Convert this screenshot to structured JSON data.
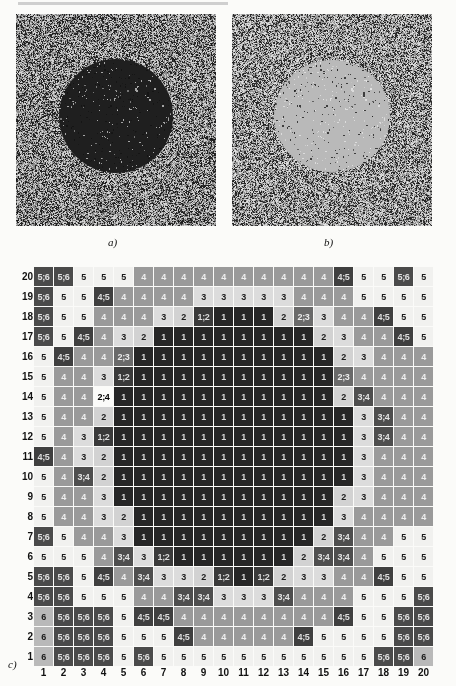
{
  "figure": {
    "panel_a": {
      "caption": "a)",
      "description": "grayscale particle field with dark circular cluster"
    },
    "panel_b": {
      "caption": "b)",
      "description": "grayscale particle field with light circular cluster"
    },
    "panel_c": {
      "caption": "c)"
    }
  },
  "chart_data": {
    "type": "heatmap",
    "title": "",
    "xlabel": "",
    "ylabel": "",
    "grid": true,
    "legend_position": "none",
    "x_tick_labels": [
      "1",
      "2",
      "3",
      "4",
      "5",
      "6",
      "7",
      "8",
      "9",
      "10",
      "11",
      "12",
      "13",
      "14",
      "15",
      "16",
      "17",
      "18",
      "19",
      "20"
    ],
    "y_tick_labels": [
      "20",
      "19",
      "18",
      "17",
      "16",
      "15",
      "14",
      "13",
      "12",
      "11",
      "10",
      "9",
      "8",
      "7",
      "6",
      "5",
      "4",
      "3",
      "2",
      "1"
    ],
    "xlim": [
      1,
      20
    ],
    "ylim": [
      1,
      20
    ],
    "value_scale": [
      "1",
      "1;2",
      "2",
      "2;3",
      "3",
      "3;4",
      "4",
      "4;5",
      "5",
      "5;6",
      "6"
    ],
    "rows": [
      {
        "label": "20",
        "cells": [
          "5;6",
          "5;6",
          "5",
          "5",
          "5",
          "4",
          "4",
          "4",
          "4",
          "4",
          "4",
          "4",
          "4",
          "4",
          "4",
          "4;5",
          "5",
          "5",
          "5;6",
          "5"
        ]
      },
      {
        "label": "19",
        "cells": [
          "5;6",
          "5",
          "5",
          "4;5",
          "4",
          "4",
          "4",
          "4",
          "3",
          "3",
          "3",
          "3",
          "3",
          "4",
          "4",
          "4",
          "5",
          "5",
          "5",
          "5"
        ]
      },
      {
        "label": "18",
        "cells": [
          "5;6",
          "5",
          "5",
          "4",
          "4",
          "4",
          "3",
          "2",
          "1;2",
          "1",
          "1",
          "1",
          "2",
          "2;3",
          "3",
          "4",
          "4",
          "4;5",
          "5",
          "5"
        ]
      },
      {
        "label": "17",
        "cells": [
          "5;6",
          "5",
          "4;5",
          "4",
          "3",
          "2",
          "1",
          "1",
          "1",
          "1",
          "1",
          "1",
          "1",
          "1",
          "2",
          "3",
          "4",
          "4",
          "4;5",
          "5"
        ]
      },
      {
        "label": "16",
        "cells": [
          "5",
          "4;5",
          "4",
          "4",
          "2;3",
          "1",
          "1",
          "1",
          "1",
          "1",
          "1",
          "1",
          "1",
          "1",
          "1",
          "2",
          "3",
          "4",
          "4",
          "4"
        ]
      },
      {
        "label": "15",
        "cells": [
          "5",
          "4",
          "4",
          "3",
          "1;2",
          "1",
          "1",
          "1",
          "1",
          "1",
          "1",
          "1",
          "1",
          "1",
          "1",
          "2;3",
          "4",
          "4",
          "4",
          "4"
        ]
      },
      {
        "label": "14",
        "cells": [
          "5",
          "4",
          "4",
          "2;4",
          "1",
          "1",
          "1",
          "1",
          "1",
          "1",
          "1",
          "1",
          "1",
          "1",
          "1",
          "2",
          "3;4",
          "4",
          "4",
          "4"
        ]
      },
      {
        "label": "13",
        "cells": [
          "5",
          "4",
          "4",
          "2",
          "1",
          "1",
          "1",
          "1",
          "1",
          "1",
          "1",
          "1",
          "1",
          "1",
          "1",
          "1",
          "3",
          "3;4",
          "4",
          "4"
        ]
      },
      {
        "label": "12",
        "cells": [
          "5",
          "4",
          "3",
          "1;2",
          "1",
          "1",
          "1",
          "1",
          "1",
          "1",
          "1",
          "1",
          "1",
          "1",
          "1",
          "1",
          "3",
          "3;4",
          "4",
          "4"
        ]
      },
      {
        "label": "11",
        "cells": [
          "4;5",
          "4",
          "3",
          "2",
          "1",
          "1",
          "1",
          "1",
          "1",
          "1",
          "1",
          "1",
          "1",
          "1",
          "1",
          "1",
          "3",
          "4",
          "4",
          "4"
        ]
      },
      {
        "label": "10",
        "cells": [
          "5",
          "4",
          "3;4",
          "2",
          "1",
          "1",
          "1",
          "1",
          "1",
          "1",
          "1",
          "1",
          "1",
          "1",
          "1",
          "1",
          "3",
          "4",
          "4",
          "4"
        ]
      },
      {
        "label": "9",
        "cells": [
          "5",
          "4",
          "4",
          "3",
          "1",
          "1",
          "1",
          "1",
          "1",
          "1",
          "1",
          "1",
          "1",
          "1",
          "1",
          "2",
          "3",
          "4",
          "4",
          "4"
        ]
      },
      {
        "label": "8",
        "cells": [
          "5",
          "4",
          "4",
          "3",
          "2",
          "1",
          "1",
          "1",
          "1",
          "1",
          "1",
          "1",
          "1",
          "1",
          "1",
          "3",
          "4",
          "4",
          "4",
          "4"
        ]
      },
      {
        "label": "7",
        "cells": [
          "5;6",
          "5",
          "4",
          "4",
          "3",
          "1",
          "1",
          "1",
          "1",
          "1",
          "1",
          "1",
          "1",
          "1",
          "2",
          "3;4",
          "4",
          "4",
          "5",
          "5"
        ]
      },
      {
        "label": "6",
        "cells": [
          "5",
          "5",
          "5",
          "4",
          "3;4",
          "3",
          "1;2",
          "1",
          "1",
          "1",
          "1",
          "1",
          "1",
          "2",
          "3;4",
          "3;4",
          "4",
          "5",
          "5",
          "5"
        ]
      },
      {
        "label": "5",
        "cells": [
          "5;6",
          "5;6",
          "5",
          "4;5",
          "4",
          "3;4",
          "3",
          "3",
          "2",
          "1;2",
          "1",
          "1;2",
          "2",
          "3",
          "3",
          "4",
          "4",
          "4;5",
          "5",
          "5"
        ]
      },
      {
        "label": "4",
        "cells": [
          "5;6",
          "5;6",
          "5",
          "5",
          "5",
          "4",
          "4",
          "3;4",
          "3;4",
          "3",
          "3",
          "3",
          "3;4",
          "4",
          "4",
          "4",
          "5",
          "5",
          "5",
          "5;6"
        ]
      },
      {
        "label": "3",
        "cells": [
          "6",
          "5;6",
          "5;6",
          "5;6",
          "5",
          "4;5",
          "4;5",
          "4",
          "4",
          "4",
          "4",
          "4",
          "4",
          "4",
          "4",
          "4;5",
          "5",
          "5",
          "5;6",
          "5;6"
        ]
      },
      {
        "label": "2",
        "cells": [
          "6",
          "5;6",
          "5;6",
          "5;6",
          "5",
          "5",
          "5",
          "4;5",
          "4",
          "4",
          "4",
          "4",
          "4",
          "4;5",
          "5",
          "5",
          "5",
          "5",
          "5;6",
          "5;6"
        ]
      },
      {
        "label": "1",
        "cells": [
          "6",
          "5;6",
          "5;6",
          "5;6",
          "5",
          "5;6",
          "5",
          "5",
          "5",
          "5",
          "5",
          "5",
          "5",
          "5",
          "5",
          "5",
          "5",
          "5;6",
          "5;6",
          "6"
        ]
      }
    ]
  }
}
